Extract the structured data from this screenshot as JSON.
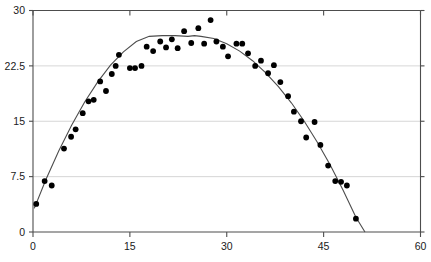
{
  "chart_data": {
    "type": "scatter",
    "title": "",
    "xlabel": "",
    "ylabel": "",
    "xlim": [
      0,
      60
    ],
    "ylim": [
      0,
      30
    ],
    "grid": true,
    "legend": null,
    "x_ticks": [
      "0",
      "15",
      "30",
      "45",
      "60"
    ],
    "x_tick_values": [
      0,
      15,
      30,
      45,
      60
    ],
    "y_ticks": [
      "0",
      "7.5",
      "15",
      "22.5",
      "30"
    ],
    "y_tick_values": [
      0,
      7.5,
      15,
      22.5,
      30
    ],
    "series": [
      {
        "name": "observations",
        "type": "scatter",
        "marker": "filled-circle",
        "color": "#000000",
        "points": [
          [
            0.5,
            3.8
          ],
          [
            1.8,
            6.9
          ],
          [
            2.9,
            6.3
          ],
          [
            4.8,
            11.3
          ],
          [
            5.9,
            12.9
          ],
          [
            6.6,
            13.9
          ],
          [
            7.7,
            16.1
          ],
          [
            8.6,
            17.7
          ],
          [
            9.4,
            17.9
          ],
          [
            10.4,
            20.4
          ],
          [
            11.3,
            19.1
          ],
          [
            12.2,
            21.4
          ],
          [
            12.8,
            22.5
          ],
          [
            13.3,
            24.0
          ],
          [
            15.0,
            22.2
          ],
          [
            15.8,
            22.2
          ],
          [
            16.8,
            22.5
          ],
          [
            17.6,
            25.1
          ],
          [
            18.6,
            24.5
          ],
          [
            19.7,
            25.8
          ],
          [
            20.6,
            25.0
          ],
          [
            21.5,
            26.1
          ],
          [
            22.4,
            24.9
          ],
          [
            23.4,
            27.2
          ],
          [
            24.5,
            25.6
          ],
          [
            25.6,
            27.6
          ],
          [
            26.5,
            25.5
          ],
          [
            27.5,
            28.7
          ],
          [
            28.4,
            25.8
          ],
          [
            29.4,
            25.1
          ],
          [
            30.2,
            23.8
          ],
          [
            31.5,
            25.5
          ],
          [
            32.4,
            25.5
          ],
          [
            33.3,
            24.2
          ],
          [
            34.4,
            22.5
          ],
          [
            35.3,
            23.2
          ],
          [
            36.4,
            21.5
          ],
          [
            37.3,
            22.6
          ],
          [
            38.3,
            20.3
          ],
          [
            39.5,
            18.4
          ],
          [
            40.4,
            16.3
          ],
          [
            41.5,
            15.0
          ],
          [
            42.3,
            12.8
          ],
          [
            43.6,
            14.9
          ],
          [
            44.5,
            11.8
          ],
          [
            45.7,
            9.0
          ],
          [
            46.8,
            6.9
          ],
          [
            47.7,
            6.8
          ],
          [
            48.6,
            6.3
          ],
          [
            50.0,
            1.8
          ]
        ]
      },
      {
        "name": "fitted-curve",
        "type": "line",
        "color": "#4d4d4d",
        "model": "quadratic",
        "vertex": [
          25.0,
          26.6
        ],
        "x_range": [
          0.2,
          51.5
        ],
        "points": [
          [
            0.2,
            3.2
          ],
          [
            2.0,
            7.1
          ],
          [
            4.0,
            11.0
          ],
          [
            6.0,
            14.5
          ],
          [
            8.0,
            17.6
          ],
          [
            10.0,
            20.3
          ],
          [
            12.0,
            22.6
          ],
          [
            14.0,
            24.4
          ],
          [
            16.0,
            25.8
          ],
          [
            18.0,
            26.5
          ],
          [
            20.0,
            26.6
          ],
          [
            22.0,
            26.6
          ],
          [
            24.0,
            26.5
          ],
          [
            25.0,
            26.6
          ],
          [
            26.0,
            26.5
          ],
          [
            28.0,
            26.2
          ],
          [
            30.0,
            25.5
          ],
          [
            32.0,
            24.5
          ],
          [
            34.0,
            23.2
          ],
          [
            36.0,
            21.6
          ],
          [
            38.0,
            19.7
          ],
          [
            40.0,
            17.5
          ],
          [
            42.0,
            15.0
          ],
          [
            44.0,
            12.2
          ],
          [
            46.0,
            9.1
          ],
          [
            48.0,
            5.7
          ],
          [
            50.0,
            2.0
          ],
          [
            51.4,
            0.0
          ]
        ]
      }
    ]
  },
  "axes": {
    "x_axis_name": "x-axis",
    "y_axis_name": "y-axis"
  }
}
